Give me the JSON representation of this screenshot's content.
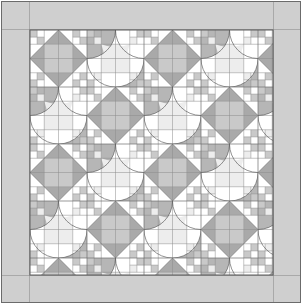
{
  "artwork": {
    "title": "Quilt Block Layout Diagram",
    "type": "pieced-quilt-pattern",
    "canvas": {
      "width": 303,
      "height": 305
    },
    "description": "Grayscale pieced quilt diagram: an eight-pointed sawtooth star grid interlocked with curved orange-peel arc blocks and four-patch corner units, framed by a plain light-gray border."
  },
  "palette": {
    "page_background": "#ffffff",
    "outline": "#555555",
    "seam_line": "#8a8a8a",
    "border_fill": "#cfcfcf",
    "border_edge": "#6b6b6b",
    "fabric_white": "#ffffff",
    "fabric_light": "#ededed",
    "fabric_medium": "#c9c9c9",
    "fabric_dark": "#a9a9a9",
    "fabric_accent": "#bdbdbd"
  },
  "frame": {
    "outer_rect": {
      "x": 1,
      "y": 1,
      "width": 300,
      "height": 302
    },
    "border_band_width": 28,
    "inner_field": {
      "x": 30,
      "y": 30,
      "width": 243,
      "height": 245
    }
  },
  "layout": {
    "tile_size": 57.0,
    "tiles_across": 4.26,
    "tiles_down": 4.3,
    "unit_divisions": 4,
    "block_types": [
      "sawtooth-star",
      "curved-arc-peel",
      "four-patch"
    ],
    "grid_visible": true
  },
  "legend": {
    "entries": [
      {
        "label": "Background",
        "color": "#ffffff"
      },
      {
        "label": "Light",
        "color": "#ededed"
      },
      {
        "label": "Medium",
        "color": "#c9c9c9"
      },
      {
        "label": "Dark",
        "color": "#a9a9a9"
      },
      {
        "label": "Border",
        "color": "#cfcfcf"
      }
    ]
  }
}
